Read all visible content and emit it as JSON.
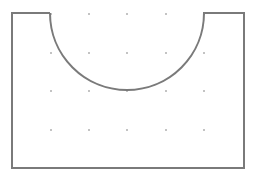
{
  "canvas": {
    "width": 258,
    "height": 175,
    "background": "#ffffff"
  },
  "shape": {
    "type": "rectangle-with-semicircular-notch",
    "stroke": "#7a7a7a",
    "stroke_width": 2,
    "left": 12,
    "top": 13,
    "right": 244,
    "bottom": 168,
    "notch_left": 50,
    "notch_right": 204,
    "notch_radius": 77
  },
  "grid": {
    "dot_color": "#777777",
    "dot_radius": 0.8,
    "xs": [
      51,
      89,
      127,
      166,
      204
    ],
    "ys": [
      14,
      53,
      91,
      130
    ]
  }
}
